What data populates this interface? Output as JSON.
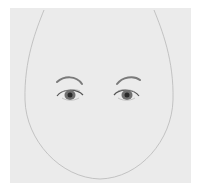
{
  "image": {
    "subject": "pencil sketch of face outline with eyebrows and eyes",
    "colors": {
      "paper": "#ebebeb",
      "background": "#ffffff",
      "outline": "#b8b8b8",
      "brow": "#7a7a7a",
      "iris": "#6a6a6a",
      "pupil": "#2a2a2a"
    }
  }
}
